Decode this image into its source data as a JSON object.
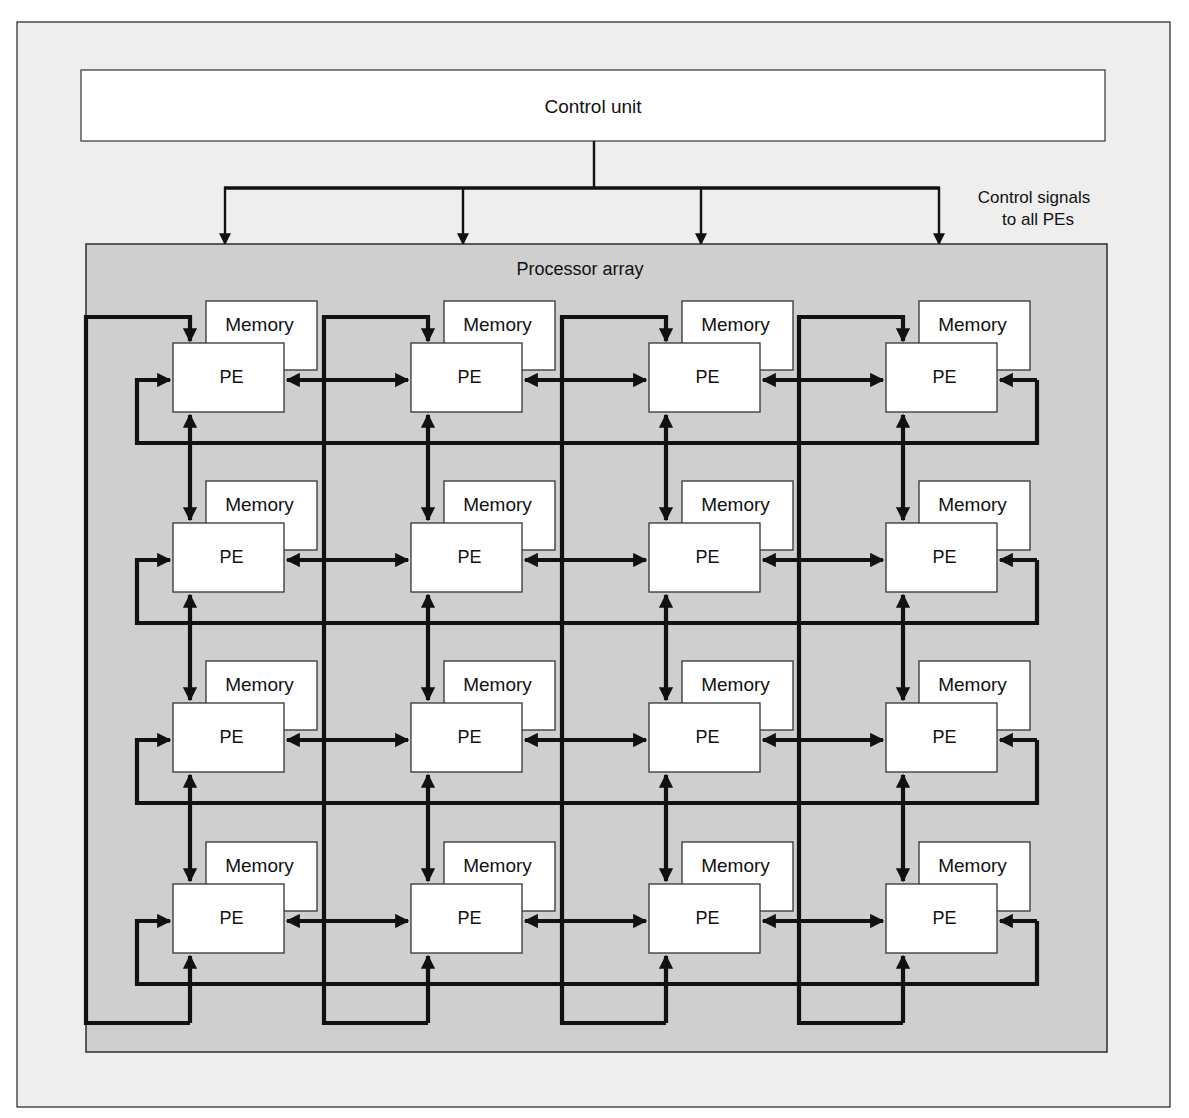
{
  "diagram": {
    "control_unit": {
      "label": "Control unit"
    },
    "control_signals": {
      "line1": "Control signals",
      "line2": "to all PEs"
    },
    "processor_array": {
      "label": "Processor array"
    },
    "grid": {
      "rows": 4,
      "cols": 4
    },
    "node_labels": {
      "memory": "Memory",
      "pe": "PE"
    },
    "nodes": [
      {
        "row": 1,
        "col": 1,
        "memory": "Memory",
        "pe": "PE"
      },
      {
        "row": 1,
        "col": 2,
        "memory": "Memory",
        "pe": "PE"
      },
      {
        "row": 1,
        "col": 3,
        "memory": "Memory",
        "pe": "PE"
      },
      {
        "row": 1,
        "col": 4,
        "memory": "Memory",
        "pe": "PE"
      },
      {
        "row": 2,
        "col": 1,
        "memory": "Memory",
        "pe": "PE"
      },
      {
        "row": 2,
        "col": 2,
        "memory": "Memory",
        "pe": "PE"
      },
      {
        "row": 2,
        "col": 3,
        "memory": "Memory",
        "pe": "PE"
      },
      {
        "row": 2,
        "col": 4,
        "memory": "Memory",
        "pe": "PE"
      },
      {
        "row": 3,
        "col": 1,
        "memory": "Memory",
        "pe": "PE"
      },
      {
        "row": 3,
        "col": 2,
        "memory": "Memory",
        "pe": "PE"
      },
      {
        "row": 3,
        "col": 3,
        "memory": "Memory",
        "pe": "PE"
      },
      {
        "row": 3,
        "col": 4,
        "memory": "Memory",
        "pe": "PE"
      },
      {
        "row": 4,
        "col": 1,
        "memory": "Memory",
        "pe": "PE"
      },
      {
        "row": 4,
        "col": 2,
        "memory": "Memory",
        "pe": "PE"
      },
      {
        "row": 4,
        "col": 3,
        "memory": "Memory",
        "pe": "PE"
      },
      {
        "row": 4,
        "col": 4,
        "memory": "Memory",
        "pe": "PE"
      }
    ],
    "colors": {
      "page_background": "#eeeeee",
      "array_background": "#cfcfcf",
      "box_fill": "#ffffff",
      "line": "#111111"
    }
  }
}
